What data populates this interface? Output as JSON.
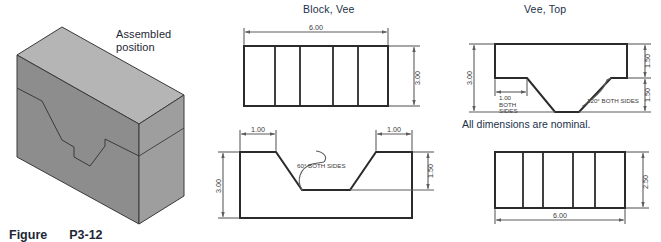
{
  "figure": {
    "caption_label": "Figure",
    "caption_number": "P3-12",
    "pictorial_note_line1": "Assembled",
    "pictorial_note_line2": "position"
  },
  "panels": {
    "block_vee_title": "Block, Vee",
    "vee_top_title": "Vee, Top",
    "general_note": "All dimensions are nominal."
  },
  "views": {
    "block_vee_front": {
      "name": "Block, Vee - front view",
      "width_dim": "6.00",
      "height_dim": "3.00",
      "divider_count": 4
    },
    "block_vee_section": {
      "name": "Block, Vee - section view",
      "left_flat_dim": "1.00",
      "right_flat_dim": "1.00",
      "overall_height_dim": "3.00",
      "groove_depth_dim": "1.50",
      "angle_note": "60° BOTH SIDES"
    },
    "vee_top_front": {
      "name": "Vee, Top - front view",
      "overall_height_dim": "3.00",
      "upper_height_dim": "1.50",
      "lower_height_dim": "1.50",
      "flat_dim_line1": "1.00",
      "flat_dim_line2": "BOTH",
      "flat_dim_line3": "SIDES",
      "angle_note": "120° BOTH SIDES"
    },
    "vee_top_end": {
      "name": "Vee, Top - end view",
      "width_dim": "6.00",
      "height_dim": "2.50",
      "divider_count": 4
    }
  },
  "colors": {
    "block_top_face": "#b3b3b3",
    "block_front_face": "#8e8e8e",
    "block_side_face": "#9b9b9b",
    "outline": "#2b2b2b",
    "dimension_line": "#5d5d5d",
    "title_text": "#21304a"
  }
}
